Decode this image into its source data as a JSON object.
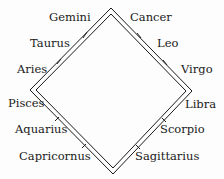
{
  "diagram": {
    "type": "zodiac-square",
    "colors": {
      "line": "#1a1a1a",
      "background": "#fdfdfd",
      "text": "#1a1a1a"
    },
    "corners": {
      "top": [
        111,
        11
      ],
      "left": [
        33,
        90
      ],
      "right": [
        189,
        92
      ],
      "bottom": [
        113,
        171
      ]
    },
    "sides": [
      {
        "name": "upper-left",
        "signs": [
          "Aries",
          "Taurus",
          "Gemini"
        ]
      },
      {
        "name": "upper-right",
        "signs": [
          "Cancer",
          "Leo",
          "Virgo"
        ]
      },
      {
        "name": "lower-right",
        "signs": [
          "Libra",
          "Scorpio",
          "Sagittarius"
        ]
      },
      {
        "name": "lower-left",
        "signs": [
          "Capricornus",
          "Aquarius",
          "Pisces"
        ]
      }
    ],
    "labels": {
      "gemini": "Gemini",
      "cancer": "Cancer",
      "taurus": "Taurus",
      "leo": "Leo",
      "aries": "Aries",
      "virgo": "Virgo",
      "pisces": "Pisces",
      "libra": "Libra",
      "aquarius": "Aquarius",
      "scorpio": "Scorpio",
      "capricornus": "Capricornus",
      "sagittarius": "Sagittarius"
    }
  }
}
